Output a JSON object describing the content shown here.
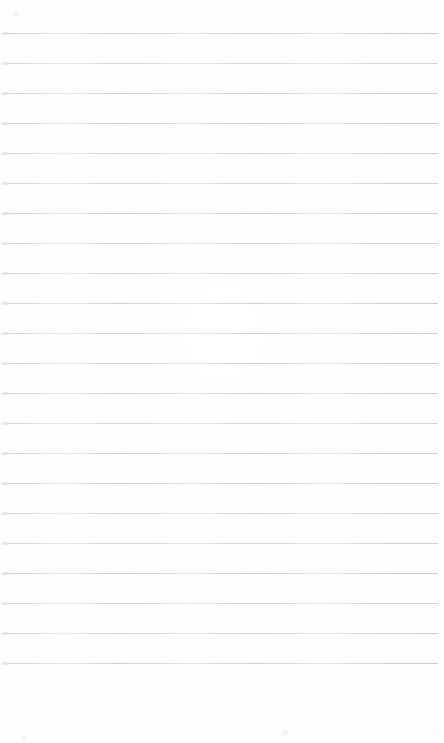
{
  "document": {
    "kind": "blank-ruled-page",
    "title": "Blank lined notebook page",
    "body_text": "",
    "page_width": 444,
    "page_height": 743,
    "background_color": "#fefefe"
  },
  "ruling": {
    "line_color": "#c9ccd1",
    "line_thickness": 1,
    "line_spacing": 30,
    "first_line_y": 33,
    "last_line_y": 663,
    "line_start_x": 5,
    "line_end_x": 438,
    "line_count": 22,
    "line_y_positions": [
      33,
      63,
      93,
      123,
      153,
      183,
      213,
      243,
      273,
      303,
      333,
      363,
      393,
      423,
      453,
      483,
      513,
      543,
      573,
      603,
      633,
      663
    ]
  },
  "margins": {
    "top_margin": 33,
    "left_margin": 5,
    "right_margin": 6,
    "bottom_margin": 80
  },
  "artifacts": {
    "specks": [
      {
        "x": 14,
        "y": 12,
        "size": 5
      },
      {
        "x": 22,
        "y": 736,
        "size": 4
      },
      {
        "x": 283,
        "y": 730,
        "size": 5
      },
      {
        "x": 430,
        "y": 726,
        "size": 4
      }
    ]
  }
}
